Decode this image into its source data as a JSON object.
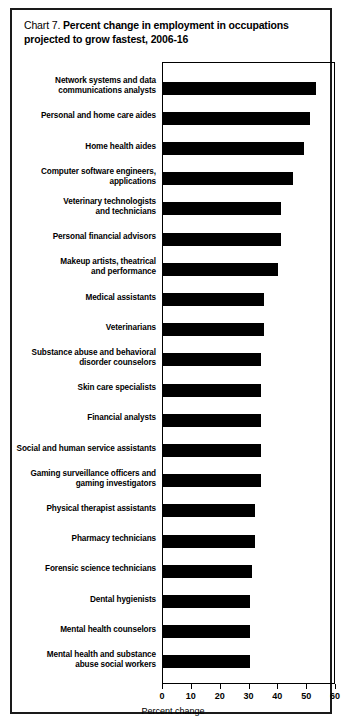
{
  "figure": {
    "chart_number_text": "Chart 7.",
    "title_text": "Percent change in employment in occupations projected to grow fastest, 2006-16",
    "xlabel": "Percent change",
    "axis_color": "#000000",
    "bar_color": "#000000",
    "background_color": "#ffffff",
    "border_color": "#1a1a1a"
  },
  "chart_data": {
    "type": "bar",
    "orientation": "horizontal",
    "title": "Chart 7. Percent change in employment in occupations projected to grow fastest, 2006-16",
    "xlabel": "Percent change",
    "ylabel": "",
    "xlim": [
      0,
      60
    ],
    "xticks": [
      0,
      10,
      20,
      30,
      40,
      50,
      60
    ],
    "xticklabels": [
      "0",
      "10",
      "20",
      "30",
      "40",
      "50",
      "60"
    ],
    "grid": false,
    "legend": null,
    "categories": [
      "Network systems and data communications analysts",
      "Personal and home care aides",
      "Home health aides",
      "Computer software engineers, applications",
      "Veterinary technologists and technicians",
      "Personal financial advisors",
      "Makeup artists, theatrical and performance",
      "Medical assistants",
      "Veterinarians",
      "Substance abuse and behavioral disorder counselors",
      "Skin care specialists",
      "Financial analysts",
      "Social and human service assistants",
      "Gaming surveillance officers and gaming investigators",
      "Physical therapist assistants",
      "Pharmacy technicians",
      "Forensic science technicians",
      "Dental hygienists",
      "Mental health counselors",
      "Mental health and substance abuse social workers"
    ],
    "category_lines": [
      [
        "Network systems and data",
        "communications analysts"
      ],
      [
        "Personal and home care aides"
      ],
      [
        "Home health aides"
      ],
      [
        "Computer software engineers,",
        "applications"
      ],
      [
        "Veterinary technologists",
        "and technicians"
      ],
      [
        "Personal financial advisors"
      ],
      [
        "Makeup artists, theatrical",
        "and performance"
      ],
      [
        "Medical assistants"
      ],
      [
        "Veterinarians"
      ],
      [
        "Substance abuse and behavioral",
        "disorder counselors"
      ],
      [
        "Skin care specialists"
      ],
      [
        "Financial analysts"
      ],
      [
        "Social and human service assistants"
      ],
      [
        "Gaming surveillance officers and",
        "gaming investigators"
      ],
      [
        "Physical therapist assistants"
      ],
      [
        "Pharmacy technicians"
      ],
      [
        "Forensic science technicians"
      ],
      [
        "Dental hygienists"
      ],
      [
        "Mental health counselors"
      ],
      [
        "Mental health and substance",
        "abuse social workers"
      ]
    ],
    "values": [
      53,
      51,
      49,
      45,
      41,
      41,
      40,
      35,
      35,
      34,
      34,
      34,
      34,
      34,
      32,
      32,
      31,
      30,
      30,
      30
    ]
  }
}
